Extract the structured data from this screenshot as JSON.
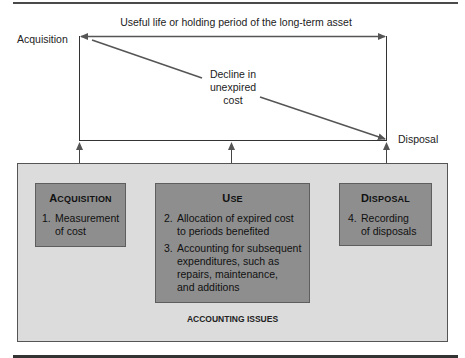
{
  "diagram": {
    "timeline": {
      "header": "Useful life or holding period of the long-term asset",
      "start_label": "Acquisition",
      "end_label": "Disposal",
      "decline_label": [
        "Decline in",
        "unexpired",
        "cost"
      ]
    },
    "accounting_issues": {
      "footer_label": "ACCOUNTING ISSUES",
      "boxes": [
        {
          "title_first": "A",
          "title_rest": "CQUISITION",
          "items": [
            {
              "num": "1.",
              "lines": [
                "Measurement",
                "of cost"
              ]
            }
          ]
        },
        {
          "title_first": "U",
          "title_rest": "SE",
          "items": [
            {
              "num": "2.",
              "lines": [
                "Allocation of expired cost",
                "to periods benefited"
              ]
            },
            {
              "num": "3.",
              "lines": [
                "Accounting for subsequent",
                "expenditures, such as",
                "repairs, maintenance,",
                "and additions"
              ]
            }
          ]
        },
        {
          "title_first": "D",
          "title_rest": "ISPOSAL",
          "items": [
            {
              "num": "4.",
              "lines": [
                "Recording",
                "of disposals"
              ]
            }
          ]
        }
      ]
    },
    "colors": {
      "rule": "#4a4a4a",
      "outer_fill": "#dcdcdc",
      "box_fill": "#8e8e8e",
      "line": "#555555"
    }
  }
}
